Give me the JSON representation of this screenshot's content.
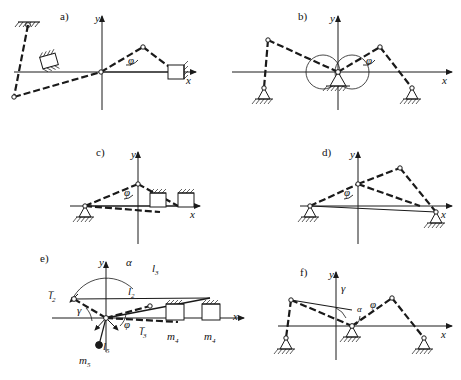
{
  "figure": {
    "panels": [
      {
        "id": "a",
        "tag": "a)",
        "axes": {
          "x": "x",
          "y": "y"
        },
        "angles": [
          "φ"
        ],
        "supports": [
          "fixed-hatched-wall-top-left",
          "slider-block-left",
          "slider-block-right"
        ]
      },
      {
        "id": "b",
        "tag": "b)",
        "axes": {
          "x": "x",
          "y": "y"
        },
        "angles": [
          "φ"
        ],
        "supports": [
          "pin-support-left",
          "pin-support-center",
          "pin-support-right"
        ]
      },
      {
        "id": "c",
        "tag": "c)",
        "axes": {
          "x": "x",
          "y": "y"
        },
        "angles": [
          "φ"
        ],
        "supports": [
          "pin-support-left",
          "slider-block-mid",
          "slider-block-right"
        ]
      },
      {
        "id": "d",
        "tag": "d)",
        "axes": {
          "x": "x",
          "y": "y"
        },
        "angles": [
          "φ"
        ],
        "supports": [
          "pin-support-left",
          "pin-support-right"
        ]
      },
      {
        "id": "e",
        "tag": "e)",
        "axes": {
          "x": "x",
          "y": "y"
        },
        "angles": [
          "α",
          "γ",
          "φ"
        ],
        "lengths": [
          "l̅₂",
          "l₂",
          "l₃",
          "l̅₃",
          "l₅"
        ],
        "masses": [
          "m₄",
          "m₄",
          "m₅"
        ],
        "supports": [
          "slider-block-mid",
          "slider-block-right",
          "point-mass-bob"
        ]
      },
      {
        "id": "f",
        "tag": "f)",
        "axes": {
          "x": "x",
          "y": "y"
        },
        "angles": [
          "γ",
          "α",
          "φ"
        ],
        "supports": [
          "pin-support-left",
          "pin-support-center",
          "pin-support-right"
        ]
      }
    ],
    "labels": {
      "a": "a)",
      "b": "b)",
      "c": "c)",
      "d": "d)",
      "e": "e)",
      "f": "f)",
      "axis_x": "x",
      "axis_y": "y",
      "phi": "φ",
      "alpha": "α",
      "gamma": "γ",
      "l2bar": "l̅",
      "l2": "l",
      "l3": "l",
      "l3bar": "l̅",
      "l5": "l",
      "m4": "m",
      "m5": "m",
      "sub2": "2",
      "sub3": "3",
      "sub4": "4",
      "sub5": "5"
    },
    "colors": {
      "stroke": "#1a1a1a",
      "background": "#ffffff"
    }
  }
}
